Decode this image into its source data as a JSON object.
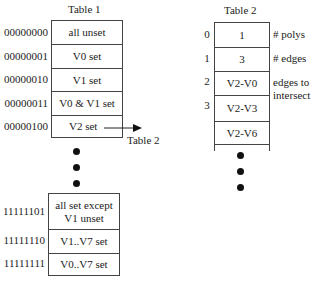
{
  "table1": {
    "title": "Table 1",
    "rows": [
      {
        "code": "00000000",
        "label": "all unset"
      },
      {
        "code": "00000001",
        "label": "V0 set"
      },
      {
        "code": "00000010",
        "label": "V1 set"
      },
      {
        "code": "00000011",
        "label": "V0 & V1 set"
      },
      {
        "code": "00000100",
        "label": "V2 set"
      }
    ],
    "tail_rows": [
      {
        "code": "11111101",
        "label": "all set except V1 unset"
      },
      {
        "code": "11111110",
        "label": "V1..V7 set"
      },
      {
        "code": "11111111",
        "label": "V0..V7 set"
      }
    ],
    "pointer_label": "Table 2"
  },
  "table2": {
    "title": "Table 2",
    "rows": [
      {
        "index": "0",
        "value": "1"
      },
      {
        "index": "1",
        "value": "3"
      },
      {
        "index": "2",
        "value": "V2-V0"
      },
      {
        "index": "3",
        "value": "V2-V3"
      },
      {
        "index": "",
        "value": "V2-V6"
      }
    ],
    "annotations": {
      "polys": "# polys",
      "edges": "# edges",
      "edges_to_intersect": "edges to intersect"
    }
  },
  "colors": {
    "line": "#444444",
    "text": "#222222",
    "dot": "#111111"
  }
}
